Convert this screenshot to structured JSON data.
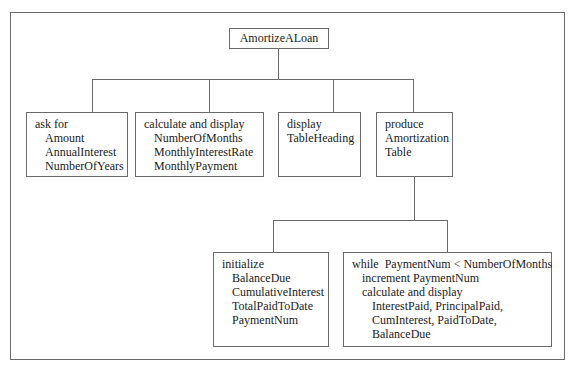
{
  "diagram": {
    "type": "structure-chart",
    "root": {
      "label": "AmortizeALoan"
    },
    "level1": [
      {
        "id": "ask-for",
        "lines": [
          {
            "text": "ask for",
            "indent": 0
          },
          {
            "text": "Amount",
            "indent": 1
          },
          {
            "text": "AnnualInterest",
            "indent": 1
          },
          {
            "text": "NumberOfYears",
            "indent": 1
          }
        ]
      },
      {
        "id": "calculate-and-display",
        "lines": [
          {
            "text": "calculate and display",
            "indent": 0
          },
          {
            "text": "NumberOfMonths",
            "indent": 1
          },
          {
            "text": "MonthlyInterestRate",
            "indent": 1
          },
          {
            "text": "MonthlyPayment",
            "indent": 1
          }
        ]
      },
      {
        "id": "display",
        "lines": [
          {
            "text": "display",
            "indent": 0
          },
          {
            "text": "TableHeading",
            "indent": 0
          }
        ]
      },
      {
        "id": "produce",
        "lines": [
          {
            "text": "produce",
            "indent": 0
          },
          {
            "text": "Amortization",
            "indent": 0
          },
          {
            "text": "Table",
            "indent": 0
          }
        ]
      }
    ],
    "level2": [
      {
        "id": "initialize",
        "parent": "produce",
        "lines": [
          {
            "text": "initialize",
            "indent": 0
          },
          {
            "text": "BalanceDue",
            "indent": 1
          },
          {
            "text": "CumulativeInterest",
            "indent": 1
          },
          {
            "text": "TotalPaidToDate",
            "indent": 1
          },
          {
            "text": "PaymentNum",
            "indent": 1
          }
        ]
      },
      {
        "id": "while-loop",
        "parent": "produce",
        "lines": [
          {
            "text": "while  PaymentNum < NumberOfMonths",
            "indent": 0
          },
          {
            "text": "increment PaymentNum",
            "indent": 1
          },
          {
            "text": "calculate and display",
            "indent": 1
          },
          {
            "text": "InterestPaid, PrincipalPaid,",
            "indent": 2
          },
          {
            "text": "CumInterest, PaidToDate,",
            "indent": 2
          },
          {
            "text": "BalanceDue",
            "indent": 2
          }
        ]
      }
    ]
  },
  "colors": {
    "line": "#6a6a6a",
    "text": "#222222",
    "background": "#ffffff"
  }
}
